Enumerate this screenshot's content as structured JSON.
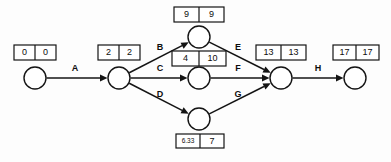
{
  "diagram": {
    "type": "project-network-diagram",
    "nodes": [
      {
        "id": "n1",
        "cx": 35,
        "cy": 78,
        "r": 11
      },
      {
        "id": "n2",
        "cx": 119,
        "cy": 78,
        "r": 11
      },
      {
        "id": "n3",
        "cx": 199,
        "cy": 37,
        "r": 11
      },
      {
        "id": "n4",
        "cx": 199,
        "cy": 78,
        "r": 11
      },
      {
        "id": "n5",
        "cx": 199,
        "cy": 119,
        "r": 11
      },
      {
        "id": "n6",
        "cx": 281,
        "cy": 78,
        "r": 11
      },
      {
        "id": "n7",
        "cx": 355,
        "cy": 78,
        "r": 11
      }
    ],
    "edges": [
      {
        "id": "e-a",
        "label": "A",
        "from": "n1",
        "to": "n2",
        "label_x": 75,
        "label_y": 69
      },
      {
        "id": "e-b",
        "label": "B",
        "from": "n2",
        "to": "n3",
        "label_x": 160,
        "label_y": 48
      },
      {
        "id": "e-c",
        "label": "C",
        "from": "n2",
        "to": "n4",
        "label_x": 160,
        "label_y": 69
      },
      {
        "id": "e-d",
        "label": "D",
        "from": "n2",
        "to": "n5",
        "label_x": 160,
        "label_y": 95
      },
      {
        "id": "e-e",
        "label": "E",
        "from": "n3",
        "to": "n6",
        "label_x": 238,
        "label_y": 48
      },
      {
        "id": "e-f",
        "label": "F",
        "from": "n4",
        "to": "n6",
        "label_x": 238,
        "label_y": 69
      },
      {
        "id": "e-g",
        "label": "G",
        "from": "n5",
        "to": "n6",
        "label_x": 238,
        "label_y": 95
      },
      {
        "id": "e-h",
        "label": "H",
        "from": "n6",
        "to": "n7",
        "label_x": 318,
        "label_y": 69
      }
    ],
    "time_boxes": [
      {
        "id": "box-n1",
        "node": "n1",
        "x": 14,
        "y": 45,
        "w": 42,
        "h": 15,
        "left": "0",
        "right": "0",
        "small": false
      },
      {
        "id": "box-n2",
        "node": "n2",
        "x": 98,
        "y": 45,
        "w": 42,
        "h": 15,
        "left": "2",
        "right": "2",
        "small": false
      },
      {
        "id": "box-n3",
        "node": "n3",
        "x": 174,
        "y": 7,
        "w": 50,
        "h": 15,
        "left": "9",
        "right": "9",
        "small": false
      },
      {
        "id": "box-n4",
        "node": "n4",
        "x": 172,
        "y": 51,
        "w": 54,
        "h": 15,
        "left": "4",
        "right": "10",
        "small": false
      },
      {
        "id": "box-n5",
        "node": "n5",
        "x": 176,
        "y": 134,
        "w": 48,
        "h": 14,
        "left": "6.33",
        "right": "7",
        "small": true
      },
      {
        "id": "box-n6",
        "node": "n6",
        "x": 256,
        "y": 45,
        "w": 50,
        "h": 15,
        "left": "13",
        "right": "13",
        "small": false
      },
      {
        "id": "box-n7",
        "node": "n7",
        "x": 333,
        "y": 45,
        "w": 46,
        "h": 15,
        "left": "17",
        "right": "17",
        "small": false
      }
    ],
    "colors": {
      "ink": "#141414",
      "paper": "#ffffff"
    }
  }
}
